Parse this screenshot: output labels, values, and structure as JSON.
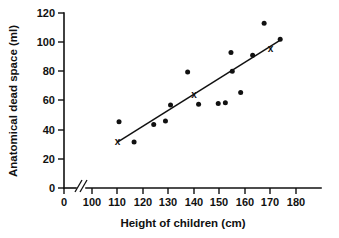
{
  "chart_data": {
    "type": "scatter",
    "title": "",
    "xlabel": "Height of children (cm)",
    "ylabel": "Anatomical dead space (ml)",
    "xlim": [
      100,
      180
    ],
    "ylim": [
      0,
      120
    ],
    "xticks": [
      "0",
      "100",
      "110",
      "120",
      "130",
      "140",
      "150",
      "160",
      "170",
      "180"
    ],
    "yticks": [
      "0",
      "20",
      "40",
      "60",
      "80",
      "100",
      "120"
    ],
    "grid": false,
    "legend": null,
    "axis_break": true,
    "axis_break_note": "//",
    "point_color": "#111111",
    "line_color": "#111111",
    "points": [
      {
        "x": 110.6,
        "y": 45.5
      },
      {
        "x": 116.5,
        "y": 31.5
      },
      {
        "x": 124.2,
        "y": 43.5
      },
      {
        "x": 128.8,
        "y": 46.0
      },
      {
        "x": 130.8,
        "y": 57.0
      },
      {
        "x": 137.5,
        "y": 79.5
      },
      {
        "x": 141.8,
        "y": 57.5
      },
      {
        "x": 149.5,
        "y": 58.0
      },
      {
        "x": 152.3,
        "y": 58.5
      },
      {
        "x": 154.5,
        "y": 93.0
      },
      {
        "x": 155.0,
        "y": 80.0
      },
      {
        "x": 158.3,
        "y": 65.5
      },
      {
        "x": 163.0,
        "y": 91.0
      },
      {
        "x": 167.5,
        "y": 113.0
      },
      {
        "x": 173.8,
        "y": 102.0
      }
    ],
    "marked_points": [
      {
        "x": 110.0,
        "y": 31.5,
        "marker": "x"
      },
      {
        "x": 140.0,
        "y": 63.5,
        "marker": "x"
      },
      {
        "x": 170.0,
        "y": 95.0,
        "marker": "x"
      }
    ],
    "fit_line": {
      "x_start": 110.0,
      "y_start": 31.5,
      "x_end": 174.0,
      "y_end": 101.5
    }
  }
}
